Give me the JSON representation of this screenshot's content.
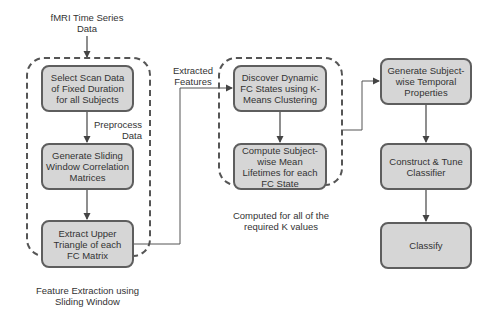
{
  "diagram": {
    "colors": {
      "box_fill": "#d6d6d6",
      "box_border": "#5e5e5e",
      "group_border": "#555555",
      "text": "#333333",
      "connector": "#555555"
    },
    "input_label": "fMRI Time Series Data",
    "edge_labels": {
      "preprocess": "Preprocess Data",
      "extracted_features": "Extracted Features"
    },
    "groups": [
      {
        "id": "feature-extraction",
        "caption": "Feature Extraction using Sliding Window",
        "boxes": [
          "Select Scan Data of Fixed Duration for all Subjects",
          "Generate Sliding Window Correlation Matrices",
          "Extract Upper Triangle of each FC Matrix"
        ]
      },
      {
        "id": "clustering",
        "caption": "Computed for all of the required K values",
        "boxes": [
          "Discover Dynamic FC States using K-Means Clustering",
          "Compute Subject-wise Mean Lifetimes for each FC State"
        ]
      }
    ],
    "pipeline": [
      "Generate Subject-wise Temporal Properties",
      "Construct & Tune Classifier",
      "Classify"
    ]
  }
}
